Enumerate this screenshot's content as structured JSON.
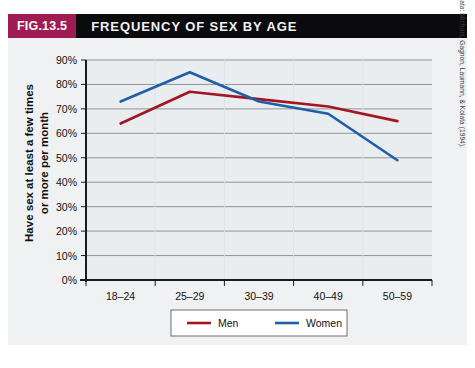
{
  "figure": {
    "badge": "FIG.13.5",
    "title": "FREQUENCY OF SEX BY AGE",
    "source_note": "Source of data: Michael, Gagnon, Laumann, & Kolata (1994).",
    "badge_color": "#9e1b53",
    "titlebar_color": "#0b0b0d",
    "body_color": "#f0f1f2",
    "plot_bg_color": "#e9edf0",
    "gridline_color": "#8a8a8a",
    "axis_color": "#1a1a1a"
  },
  "chart_data": {
    "type": "line",
    "title": "FREQUENCY OF SEX BY AGE",
    "xlabel": "",
    "ylabel": "Have sex at least a few times or more per month",
    "ylabel_lines": [
      "Have sex at least a few times",
      "or more per month"
    ],
    "categories": [
      "18–24",
      "25–29",
      "30–39",
      "40–49",
      "50–59"
    ],
    "series": [
      {
        "name": "Men",
        "color": "#a31621",
        "values": [
          64,
          77,
          74,
          71,
          65
        ]
      },
      {
        "name": "Women",
        "color": "#1f5fa8",
        "values": [
          73,
          85,
          73,
          68,
          49
        ]
      }
    ],
    "ylim": [
      0,
      90
    ],
    "ytick_labels": [
      "0%",
      "10%",
      "20%",
      "30%",
      "40%",
      "50%",
      "60%",
      "70%",
      "80%",
      "90%"
    ],
    "ytick_values": [
      0,
      10,
      20,
      30,
      40,
      50,
      60,
      70,
      80,
      90
    ],
    "grid": true,
    "legend_position": "bottom",
    "legend": [
      {
        "label": "Men",
        "color": "#a31621"
      },
      {
        "label": "Women",
        "color": "#1f5fa8"
      }
    ]
  }
}
